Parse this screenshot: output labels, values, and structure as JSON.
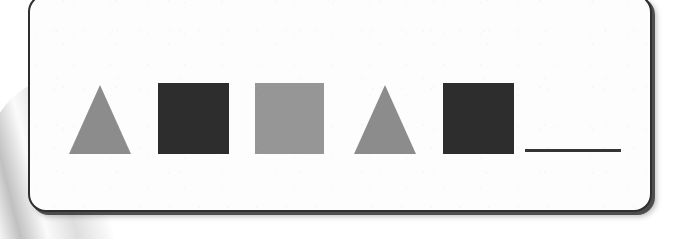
{
  "page": {
    "background_color": "#ffffff",
    "card_background_color": "#fdfdfd",
    "card_border_color": "#2f2f2f"
  },
  "worksheet": {
    "type": "shape-pattern-sequence",
    "answer_blank_color": "#343434",
    "palette": {
      "medium_gray": "#8c8c8c",
      "dark_charcoal": "#2d2d2d",
      "light_gray": "#969696"
    },
    "sequence": [
      {
        "position": 1,
        "shape": "triangle",
        "color": "#8c8c8c",
        "color_name": "medium gray",
        "width": 62,
        "height": 69
      },
      {
        "position": 2,
        "shape": "square",
        "color": "#2d2d2d",
        "color_name": "dark charcoal",
        "width": 71,
        "height": 71
      },
      {
        "position": 3,
        "shape": "square",
        "color": "#969696",
        "color_name": "light gray",
        "width": 69,
        "height": 71
      },
      {
        "position": 4,
        "shape": "triangle",
        "color": "#8c8c8c",
        "color_name": "medium gray",
        "width": 62,
        "height": 69
      },
      {
        "position": 5,
        "shape": "square",
        "color": "#2d2d2d",
        "color_name": "dark charcoal",
        "width": 71,
        "height": 71
      },
      {
        "position": 6,
        "shape": "blank",
        "color": "#343434",
        "color_name": "answer blank line",
        "width": 96,
        "height": 3
      }
    ]
  }
}
